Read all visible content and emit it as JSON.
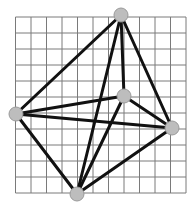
{
  "diagram": {
    "type": "graph-on-grid",
    "colors": {
      "background": "#ffffff",
      "grid": "#7a7a7a",
      "edge": "#111111",
      "node_fill": "#bdbdbd",
      "node_stroke": "#9a9a9a"
    },
    "grid": {
      "x0": 15.5,
      "y0": 17,
      "cols": 11,
      "rows": 11,
      "cell_w": 15.5,
      "cell_h": 16
    },
    "nodes": [
      {
        "id": "top",
        "x": 121,
        "y": 15
      },
      {
        "id": "middle",
        "x": 124,
        "y": 96
      },
      {
        "id": "left",
        "x": 16,
        "y": 114
      },
      {
        "id": "right",
        "x": 172,
        "y": 128
      },
      {
        "id": "bottom",
        "x": 77,
        "y": 194
      }
    ],
    "node_radius": 7,
    "edge_width": 3,
    "edges": [
      [
        "left",
        "top"
      ],
      [
        "left",
        "middle"
      ],
      [
        "left",
        "right"
      ],
      [
        "left",
        "bottom"
      ],
      [
        "top",
        "middle"
      ],
      [
        "top",
        "right"
      ],
      [
        "top",
        "bottom"
      ],
      [
        "middle",
        "right"
      ],
      [
        "middle",
        "bottom"
      ],
      [
        "bottom",
        "right"
      ]
    ]
  }
}
